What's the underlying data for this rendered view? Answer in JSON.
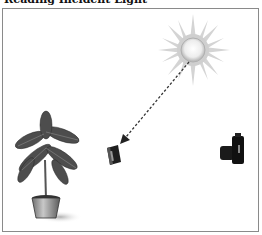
{
  "title": "Reading Incident Light",
  "diagram": {
    "elements": [
      "sun",
      "light-meter",
      "plant",
      "camera"
    ],
    "arrow": {
      "from": "sun",
      "to": "light-meter",
      "style": "dashed"
    }
  }
}
